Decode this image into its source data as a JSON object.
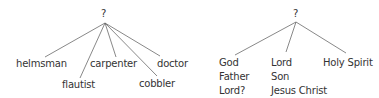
{
  "diagrams": [
    {
      "root": "?",
      "leaves": [
        "helmsman",
        "flautist",
        "carpenter",
        "cobbler",
        "doctor"
      ]
    },
    {
      "root": "?",
      "groups": [
        [
          "God",
          "Father",
          "Lord?"
        ],
        [
          "Lord",
          "Son",
          "Jesus Christ"
        ],
        [
          "Holy Spirit"
        ]
      ]
    }
  ],
  "colors": {
    "line": "#555555",
    "text": "#333333",
    "background": "#ffffff"
  }
}
